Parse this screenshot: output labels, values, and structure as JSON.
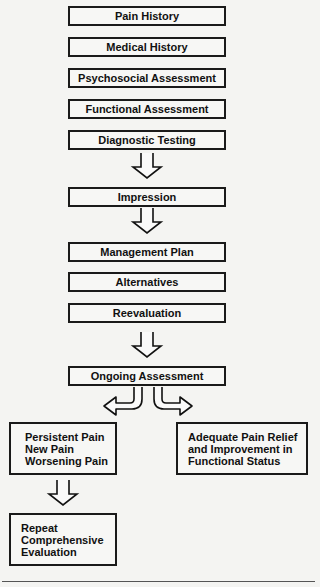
{
  "diagram": {
    "steps": [
      "Pain History",
      "Medical History",
      "Psychosocial Assessment",
      "Functional Assessment",
      "Diagnostic Testing",
      "Impression",
      "Management Plan",
      "Alternatives",
      "Reevaluation",
      "Ongoing Assessment"
    ],
    "left_branch": {
      "lines": [
        "Persistent Pain",
        "New Pain",
        "Worsening Pain"
      ]
    },
    "right_branch": {
      "lines": [
        "Adequate Pain Relief",
        "and Improvement in",
        "Functional Status"
      ]
    },
    "repeat": {
      "lines": [
        "Repeat",
        "Comprehensive",
        "Evaluation"
      ]
    }
  }
}
